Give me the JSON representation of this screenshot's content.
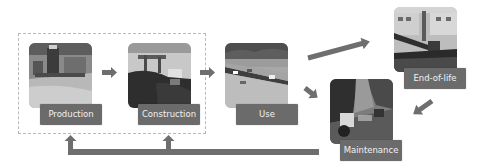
{
  "diagram": {
    "stages": [
      {
        "id": "production",
        "label": "Production",
        "image": "asphalt-plant-photo"
      },
      {
        "id": "construction",
        "label": "Construction",
        "image": "paving-machine-photo"
      },
      {
        "id": "use",
        "label": "Use",
        "image": "highway-traffic-photo"
      },
      {
        "id": "end-of-life",
        "label": "End-of-life",
        "image": "excavator-demolition-photo"
      },
      {
        "id": "maintenance",
        "label": "Maintenance",
        "image": "road-roller-repair-photo"
      }
    ],
    "group": {
      "label": "",
      "members": [
        "production",
        "construction"
      ],
      "style": "dashed"
    },
    "arrows": [
      {
        "from": "production",
        "to": "construction"
      },
      {
        "from": "construction",
        "to": "use"
      },
      {
        "from": "use",
        "to": "end-of-life"
      },
      {
        "from": "use",
        "to": "maintenance"
      },
      {
        "from": "end-of-life",
        "to": "maintenance"
      },
      {
        "from": "maintenance",
        "to": "production",
        "type": "feedback"
      },
      {
        "from": "maintenance",
        "to": "construction",
        "type": "feedback"
      }
    ],
    "colors": {
      "arrow": "#6e6e6e",
      "label_bg": "#6b6b6b",
      "label_text": "#f2f2f2",
      "group_border": "#b9b9b9"
    }
  }
}
